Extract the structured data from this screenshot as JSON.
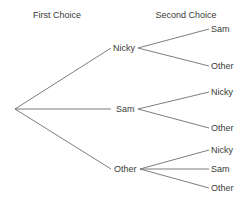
{
  "headers": {
    "first": "First Choice",
    "second": "Second Choice"
  },
  "tree": {
    "first_choices": [
      {
        "label": "Nicky",
        "second_choices": [
          {
            "label": "Sam"
          },
          {
            "label": "Other"
          }
        ]
      },
      {
        "label": "Sam",
        "second_choices": [
          {
            "label": "Nicky"
          },
          {
            "label": "Other"
          }
        ]
      },
      {
        "label": "Other",
        "second_choices": [
          {
            "label": "Nicky"
          },
          {
            "label": "Sam"
          },
          {
            "label": "Other"
          }
        ]
      }
    ]
  },
  "colors": {
    "line": "#6e6e6e",
    "text": "#3a3a3a",
    "background": "#ffffff"
  }
}
